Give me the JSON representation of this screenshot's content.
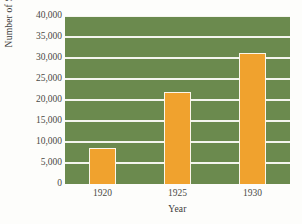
{
  "chart_data": {
    "type": "bar",
    "title": "",
    "xlabel": "Year",
    "ylabel": "Number of Stores",
    "categories": [
      "1920",
      "1925",
      "1930"
    ],
    "values": [
      8500,
      22000,
      31300
    ],
    "ylim": [
      0,
      40000
    ],
    "ytick_labels": [
      "0",
      "5,000",
      "10,000",
      "15,000",
      "20,000",
      "25,000",
      "30,000",
      "35,000",
      "40,000"
    ],
    "ytick_values": [
      0,
      5000,
      10000,
      15000,
      20000,
      25000,
      30000,
      35000,
      40000
    ],
    "ystep": 5000,
    "grid": "horizontal",
    "legend": "none",
    "colors": {
      "bar": "#f0a22e",
      "bar_edge": "#fbf6ea",
      "plot_background": "#6b8a4e",
      "gridline": "#f4f5ee",
      "text": "#4a4a46",
      "figure_background": "#fdfdfb"
    }
  }
}
